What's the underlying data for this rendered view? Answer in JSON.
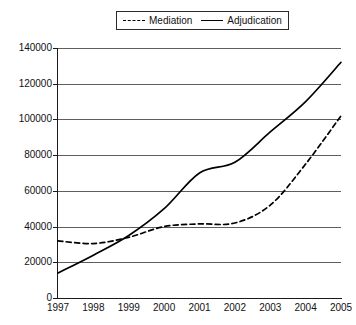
{
  "chart_data": {
    "type": "line",
    "title": "",
    "subtitle": "",
    "xlabel": "",
    "ylabel": "",
    "x": [
      1997,
      1998,
      1999,
      2000,
      2001,
      2002,
      2003,
      2004,
      2005
    ],
    "categories": [
      "1997",
      "1998",
      "1999",
      "2000",
      "2001",
      "2002",
      "2003",
      "2004",
      "2005"
    ],
    "series": [
      {
        "name": "Mediation",
        "style": "dashed",
        "color": "#000000",
        "values": [
          32000,
          30500,
          34000,
          40000,
          41500,
          42000,
          52000,
          75000,
          102000
        ]
      },
      {
        "name": "Adjudication",
        "style": "solid",
        "color": "#000000",
        "values": [
          14000,
          24000,
          35000,
          50000,
          70000,
          76000,
          93000,
          110000,
          132000
        ]
      }
    ],
    "ylim": [
      0,
      140000
    ],
    "ytick_values": [
      0,
      20000,
      40000,
      60000,
      80000,
      100000,
      120000,
      140000
    ],
    "ytick_labels": [
      "0",
      "20000",
      "40000",
      "60000",
      "80000",
      "100000",
      "120000",
      "140000"
    ],
    "xlim": [
      1997,
      2005
    ],
    "grid": "horizontal",
    "legend_position": "top-center",
    "legend_entries": [
      {
        "label": "Mediation",
        "style": "dashed"
      },
      {
        "label": "Adjudication",
        "style": "solid"
      }
    ]
  },
  "colors": {
    "background": "#ffffff",
    "axis": "#1a1a1a",
    "gridline": "#5e5e5e",
    "series": "#000000",
    "text": "#111111"
  }
}
